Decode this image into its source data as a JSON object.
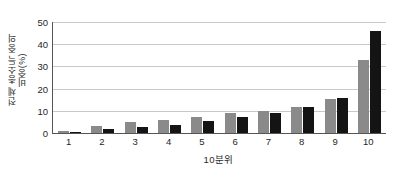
{
  "chart_data": {
    "type": "bar",
    "title": "",
    "xlabel": "10분위",
    "ylabel_lines": [
      "전체 총소득 중의",
      "비중(%)"
    ],
    "categories": [
      "1",
      "2",
      "3",
      "4",
      "5",
      "6",
      "7",
      "8",
      "9",
      "10"
    ],
    "series": [
      {
        "name": "series-gray",
        "color": "#8a8a8a",
        "values": [
          1.0,
          3.2,
          5.0,
          6.0,
          7.3,
          8.8,
          10.0,
          11.5,
          15.2,
          33.0
        ]
      },
      {
        "name": "series-black",
        "color": "#141414",
        "values": [
          0.6,
          1.6,
          2.6,
          3.8,
          5.5,
          7.0,
          8.8,
          11.8,
          15.8,
          46.0
        ]
      }
    ],
    "ylim": [
      0,
      50
    ],
    "yticks": [
      0,
      10,
      20,
      30,
      40,
      50
    ],
    "ytick_labels": [
      "0",
      "10",
      "20",
      "30",
      "40",
      "50"
    ],
    "grid": true,
    "legend": "none"
  }
}
